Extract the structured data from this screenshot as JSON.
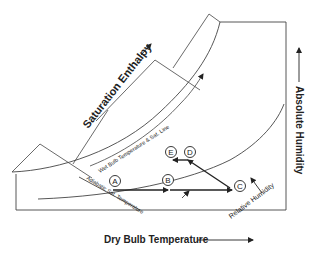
{
  "diagram": {
    "type": "psychrometric-chart",
    "labels": {
      "saturation_enthalpy": "Saturation Enthalpy",
      "absolute_humidity": "Absolute Humidity",
      "dry_bulb_temperature": "Dry Bulb Temperature",
      "wet_bulb_sat_line": "Wet Bulb Temperature & Sat. Line",
      "adiabatic_sat_temperature": "Adiabatic Sat. Temperature",
      "relative_humidity": "Relative Humidity"
    },
    "points": [
      {
        "id": "A",
        "label": "A"
      },
      {
        "id": "B",
        "label": "B"
      },
      {
        "id": "C",
        "label": "C"
      },
      {
        "id": "D",
        "label": "D"
      },
      {
        "id": "E",
        "label": "E"
      }
    ],
    "processes": [
      {
        "from": "A",
        "to": "C",
        "description": "horizontal heating through B"
      },
      {
        "from": "C",
        "to": "D",
        "description": "diagonal toward upper-left"
      },
      {
        "from": "D",
        "to": "E",
        "description": "short horizontal leftward"
      }
    ],
    "colors": {
      "line": "#333333",
      "text": "#222222",
      "background": "#ffffff"
    }
  }
}
